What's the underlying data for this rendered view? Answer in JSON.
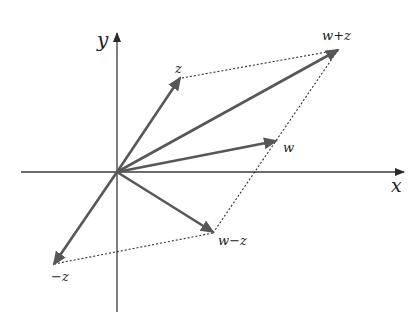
{
  "diagram": {
    "colors": {
      "axis": "#3a3a3a",
      "vector": "#575757",
      "dotted": "#2e2e2e",
      "label": "#222222"
    },
    "axes": {
      "x_label": "x",
      "y_label": "y",
      "origin": [
        117,
        172
      ]
    },
    "vectors": [
      {
        "id": "z",
        "label": "z",
        "tip": [
          180,
          78
        ]
      },
      {
        "id": "w_plus_z",
        "label": "w+z",
        "tip": [
          338,
          50
        ]
      },
      {
        "id": "w",
        "label": "w",
        "tip": [
          276,
          141
        ]
      },
      {
        "id": "w_minus_z",
        "label": "w−z",
        "tip": [
          213,
          232
        ]
      },
      {
        "id": "neg_z",
        "label": "−z",
        "tip": [
          54,
          264
        ]
      }
    ],
    "dotted_lines": [
      {
        "from": "z",
        "to": "w+z"
      },
      {
        "from": "w-z",
        "to": "w+z"
      },
      {
        "from": "−z",
        "to": "w−z"
      }
    ]
  }
}
